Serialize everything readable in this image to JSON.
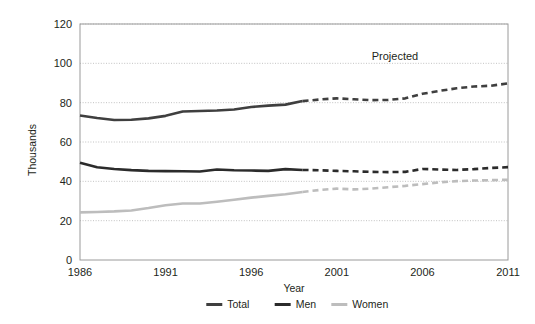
{
  "chart_data": {
    "type": "line",
    "title": "",
    "xlabel": "Year",
    "ylabel": "Thousands",
    "xlim": [
      1986,
      2011
    ],
    "ylim": [
      0,
      120
    ],
    "ytick_step": 20,
    "xtick_step": 5,
    "grid": true,
    "legend_position": "bottom",
    "annotations": [
      {
        "text": "Projected",
        "x": 2004.5,
        "y": 105
      }
    ],
    "projection_start_year": 1999,
    "x": [
      1986,
      1987,
      1988,
      1989,
      1990,
      1991,
      1992,
      1993,
      1994,
      1995,
      1996,
      1997,
      1998,
      1999,
      2000,
      2001,
      2002,
      2003,
      2004,
      2005,
      2006,
      2007,
      2008,
      2009,
      2010,
      2011
    ],
    "xtick_labels": [
      "1986",
      "1991",
      "1996",
      "2001",
      "2006",
      "2011"
    ],
    "ytick_labels": [
      "0",
      "20",
      "40",
      "60",
      "80",
      "100",
      "120"
    ],
    "series": [
      {
        "name": "Total",
        "color": "#3f3f3f",
        "width": 2.6,
        "values": [
          73.5,
          72.2,
          71.2,
          71.3,
          72.0,
          73.3,
          75.5,
          75.8,
          76.0,
          76.5,
          77.8,
          78.5,
          79.0,
          80.8,
          81.6,
          82.2,
          81.7,
          81.3,
          81.4,
          82.2,
          84.5,
          86.0,
          87.3,
          88.2,
          88.6,
          89.8
        ]
      },
      {
        "name": "Men",
        "color": "#2b2b2b",
        "width": 2.6,
        "values": [
          49.5,
          47.2,
          46.3,
          45.7,
          45.3,
          45.2,
          45.1,
          45.0,
          46.0,
          45.6,
          45.5,
          45.3,
          46.2,
          45.8,
          45.6,
          45.3,
          45.1,
          44.8,
          44.7,
          44.8,
          46.3,
          46.0,
          45.8,
          46.2,
          46.8,
          47.2
        ]
      },
      {
        "name": "Women",
        "color": "#bdbdbd",
        "width": 2.6,
        "values": [
          24.2,
          24.4,
          24.7,
          25.2,
          26.4,
          27.8,
          28.7,
          28.7,
          29.6,
          30.6,
          31.7,
          32.6,
          33.4,
          34.6,
          35.6,
          36.3,
          35.9,
          36.3,
          37.0,
          37.7,
          38.6,
          39.5,
          40.1,
          40.4,
          40.6,
          40.8
        ]
      }
    ]
  },
  "legend": {
    "items": [
      {
        "label": "Total",
        "color": "#3f3f3f"
      },
      {
        "label": "Men",
        "color": "#2b2b2b"
      },
      {
        "label": "Women",
        "color": "#bdbdbd"
      }
    ]
  },
  "axes": {
    "x_title": "Year",
    "y_title": "Thousands"
  },
  "annotation": {
    "projected_label": "Projected"
  }
}
